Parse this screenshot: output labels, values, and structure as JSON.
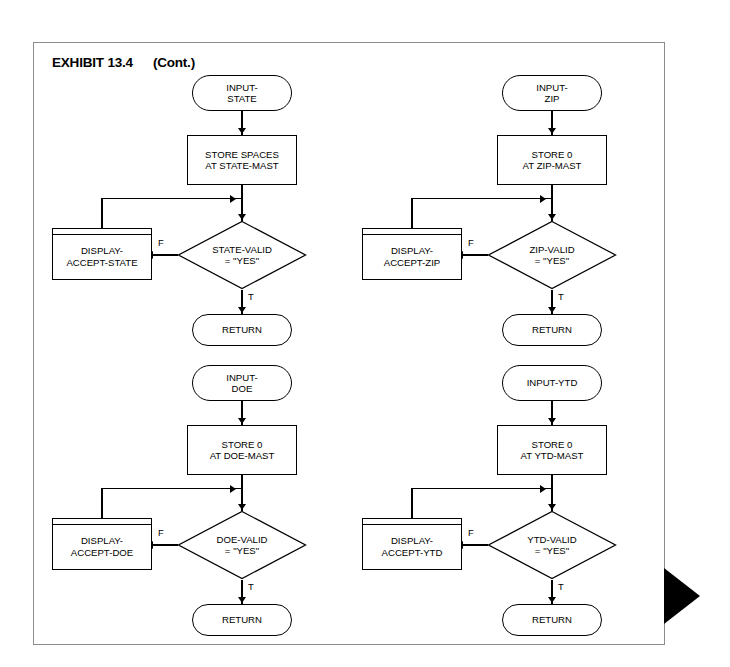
{
  "exhibit": {
    "title": "EXHIBIT 13.4",
    "continued": "(Cont.)"
  },
  "branch_labels": {
    "false": "F",
    "true": "T"
  },
  "charts": [
    {
      "id": "state",
      "start": "INPUT-\nSTATE",
      "start_line1": "INPUT-",
      "start_line2": "STATE",
      "process_line1": "STORE SPACES",
      "process_line2": "AT STATE-MAST",
      "decision_line1": "STATE-VALID",
      "decision_line2": "= \"YES\"",
      "display_line1": "DISPLAY-",
      "display_line2": "ACCEPT-STATE",
      "end": "RETURN"
    },
    {
      "id": "zip",
      "start_line1": "INPUT-",
      "start_line2": "ZIP",
      "process_line1": "STORE 0",
      "process_line2": "AT ZIP-MAST",
      "decision_line1": "ZIP-VALID",
      "decision_line2": "= \"YES\"",
      "display_line1": "DISPLAY-",
      "display_line2": "ACCEPT-ZIP",
      "end": "RETURN"
    },
    {
      "id": "doe",
      "start_line1": "INPUT-",
      "start_line2": "DOE",
      "process_line1": "STORE 0",
      "process_line2": "AT DOE-MAST",
      "decision_line1": "DOE-VALID",
      "decision_line2": "= \"YES\"",
      "display_line1": "DISPLAY-",
      "display_line2": "ACCEPT-DOE",
      "end": "RETURN"
    },
    {
      "id": "ytd",
      "start_line1": "INPUT-YTD",
      "start_line2": "",
      "process_line1": "STORE 0",
      "process_line2": "AT YTD-MAST",
      "decision_line1": "YTD-VALID",
      "decision_line2": "= \"YES\"",
      "display_line1": "DISPLAY-",
      "display_line2": "ACCEPT-YTD",
      "end": "RETURN"
    }
  ],
  "colors": {
    "stroke": "#000000",
    "page_border": "#8d8d8d",
    "background": "#ffffff",
    "marker": "#000000"
  }
}
